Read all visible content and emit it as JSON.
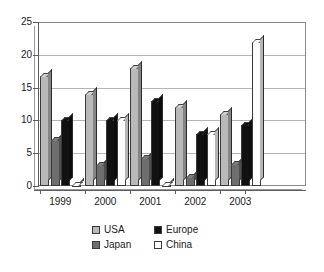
{
  "chart_data": {
    "type": "bar",
    "title": "",
    "subtitle": "",
    "xlabel": "",
    "ylabel": "",
    "categories": [
      "1999",
      "2000",
      "2001",
      "2002",
      "2003"
    ],
    "series": [
      {
        "name": "USA",
        "color": "#b9b9b9",
        "values": [
          16.8,
          14.0,
          18.0,
          12.0,
          11.0
        ]
      },
      {
        "name": "Japan",
        "color": "#6e6e6e",
        "values": [
          7.0,
          3.2,
          4.2,
          1.3,
          3.3
        ]
      },
      {
        "name": "Europe",
        "color": "#111111",
        "values": [
          10.0,
          10.0,
          13.0,
          8.0,
          9.3
        ]
      },
      {
        "name": "China",
        "color": "#fdfdfd",
        "values": [
          0.2,
          10.0,
          0.2,
          8.0,
          22.0
        ]
      }
    ],
    "ylim": [
      0,
      25
    ],
    "ytick_labels": [
      "0",
      "5",
      "10",
      "15",
      "20",
      "25"
    ],
    "ytick_values": [
      0,
      5,
      10,
      15,
      20,
      25
    ],
    "grid": true,
    "legend_position": "bottom",
    "legend_entries": [
      "USA",
      "Europe",
      "Japan",
      "China"
    ]
  },
  "legend": {
    "usa": "USA",
    "europe": "Europe",
    "japan": "Japan",
    "china": "China"
  }
}
